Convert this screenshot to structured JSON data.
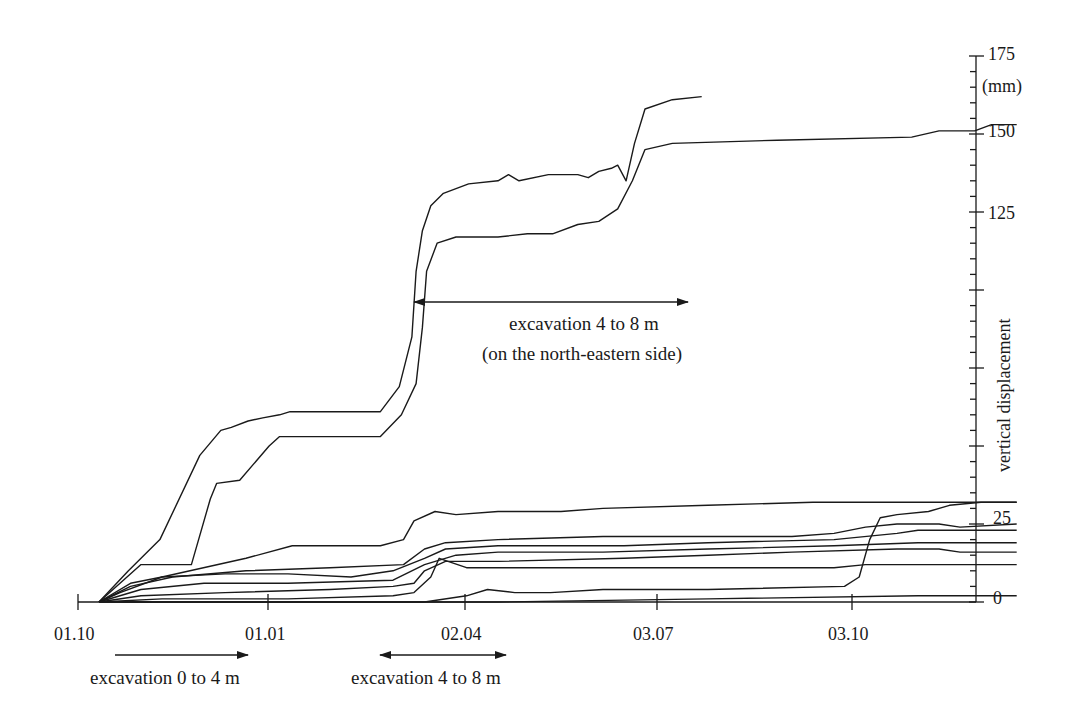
{
  "chart_data": {
    "type": "line",
    "title": "",
    "xlabel": "",
    "ylabel": "vertical displacement",
    "y_unit": "(mm)",
    "ylim": [
      0,
      175
    ],
    "y_ticks": [
      0,
      25,
      125,
      150,
      175
    ],
    "y_tick_labels": [
      "0",
      "25",
      "125",
      "150",
      "175"
    ],
    "y_minor_tick_step": 5,
    "y_axis_position": "right",
    "x_ticks": [
      "01.10",
      "01.01",
      "02.04",
      "03.07",
      "03.10"
    ],
    "x_unit_note": "x values below are approximate days since 01.10",
    "grid": false,
    "legend": null,
    "annotations": [
      {
        "text": "excavation 4 to 8 m",
        "subtext": "(on the north-eastern side)",
        "arrow": "double",
        "x_range_days": [
          163,
          291
        ],
        "y_mm": 99
      },
      {
        "text": "excavation 0 to 4 m",
        "arrow": "right",
        "x_range_days": [
          7,
          80
        ],
        "position": "below-axis"
      },
      {
        "text": "excavation 4 to 8 m",
        "arrow": "double",
        "x_range_days": [
          143,
          205
        ],
        "position": "below-axis"
      }
    ],
    "series": [
      {
        "name": "curve-1",
        "points": [
          [
            10,
            0
          ],
          [
            24,
            10
          ],
          [
            39,
            20
          ],
          [
            58,
            47
          ],
          [
            68,
            55
          ],
          [
            73,
            56
          ],
          [
            81,
            58
          ],
          [
            88,
            59
          ],
          [
            96,
            60
          ],
          [
            101,
            61
          ],
          [
            144,
            61
          ],
          [
            153,
            69
          ],
          [
            159,
            85
          ],
          [
            161,
            106
          ],
          [
            164,
            119
          ],
          [
            168,
            127
          ],
          [
            174,
            131
          ],
          [
            186,
            134
          ],
          [
            200,
            135
          ],
          [
            205,
            137
          ],
          [
            210,
            135
          ],
          [
            224,
            137
          ],
          [
            238,
            137
          ],
          [
            243,
            136
          ],
          [
            248,
            138
          ],
          [
            254,
            139
          ],
          [
            257,
            140
          ],
          [
            261,
            135
          ],
          [
            265,
            147
          ],
          [
            270,
            158
          ],
          [
            283,
            161
          ],
          [
            297,
            162
          ]
        ]
      },
      {
        "name": "curve-2",
        "points": [
          [
            10,
            0
          ],
          [
            30,
            12
          ],
          [
            54,
            12
          ],
          [
            63,
            33
          ],
          [
            66,
            38
          ],
          [
            77,
            39
          ],
          [
            91,
            50
          ],
          [
            96,
            53
          ],
          [
            144,
            53
          ],
          [
            154,
            60
          ],
          [
            161,
            70
          ],
          [
            164,
            88
          ],
          [
            166,
            106
          ],
          [
            171,
            115
          ],
          [
            180,
            117
          ],
          [
            200,
            117
          ],
          [
            214,
            118
          ],
          [
            226,
            118
          ],
          [
            238,
            121
          ],
          [
            248,
            122
          ],
          [
            257,
            126
          ],
          [
            264,
            135
          ],
          [
            270,
            145
          ],
          [
            283,
            147
          ],
          [
            333,
            148
          ],
          [
            397,
            149
          ],
          [
            410,
            151
          ],
          [
            427,
            151
          ],
          [
            435,
            153
          ],
          [
            447,
            153
          ]
        ]
      },
      {
        "name": "curve-3",
        "points": [
          [
            10,
            0
          ],
          [
            20,
            3
          ],
          [
            40,
            8
          ],
          [
            80,
            14
          ],
          [
            102,
            18
          ],
          [
            144,
            18
          ],
          [
            155,
            20
          ],
          [
            160,
            26
          ],
          [
            170,
            29
          ],
          [
            180,
            28
          ],
          [
            200,
            29
          ],
          [
            215,
            29
          ],
          [
            230,
            29
          ],
          [
            250,
            30
          ],
          [
            300,
            31
          ],
          [
            350,
            32
          ],
          [
            400,
            32
          ],
          [
            447,
            32
          ]
        ]
      },
      {
        "name": "curve-4",
        "points": [
          [
            10,
            0
          ],
          [
            25,
            5
          ],
          [
            45,
            8
          ],
          [
            80,
            10
          ],
          [
            120,
            11
          ],
          [
            155,
            12
          ],
          [
            165,
            17
          ],
          [
            175,
            19
          ],
          [
            200,
            20
          ],
          [
            250,
            21
          ],
          [
            300,
            21
          ],
          [
            340,
            21
          ],
          [
            360,
            22
          ],
          [
            375,
            24
          ],
          [
            390,
            25
          ],
          [
            410,
            25
          ],
          [
            420,
            24
          ],
          [
            447,
            25
          ]
        ]
      },
      {
        "name": "curve-5",
        "points": [
          [
            10,
            0
          ],
          [
            25,
            6
          ],
          [
            40,
            8
          ],
          [
            70,
            9
          ],
          [
            100,
            9
          ],
          [
            130,
            8
          ],
          [
            150,
            10
          ],
          [
            165,
            14
          ],
          [
            175,
            17
          ],
          [
            200,
            18
          ],
          [
            260,
            18
          ],
          [
            300,
            19
          ],
          [
            360,
            20
          ],
          [
            390,
            22
          ],
          [
            400,
            23
          ],
          [
            447,
            23
          ]
        ]
      },
      {
        "name": "curve-6",
        "points": [
          [
            10,
            0
          ],
          [
            30,
            4
          ],
          [
            60,
            6
          ],
          [
            100,
            6
          ],
          [
            150,
            7
          ],
          [
            165,
            12
          ],
          [
            180,
            15
          ],
          [
            200,
            16
          ],
          [
            250,
            16
          ],
          [
            300,
            17
          ],
          [
            360,
            18
          ],
          [
            400,
            19
          ],
          [
            447,
            19
          ]
        ]
      },
      {
        "name": "curve-7",
        "points": [
          [
            10,
            0
          ],
          [
            30,
            2
          ],
          [
            70,
            3
          ],
          [
            120,
            4
          ],
          [
            150,
            5
          ],
          [
            160,
            6
          ],
          [
            165,
            10
          ],
          [
            175,
            13
          ],
          [
            200,
            13
          ],
          [
            260,
            14
          ],
          [
            300,
            15
          ],
          [
            340,
            16
          ],
          [
            390,
            17
          ],
          [
            410,
            17
          ],
          [
            420,
            16
          ],
          [
            447,
            16
          ]
        ]
      },
      {
        "name": "curve-8",
        "points": [
          [
            10,
            0
          ],
          [
            40,
            1
          ],
          [
            100,
            1
          ],
          [
            150,
            2
          ],
          [
            160,
            3
          ],
          [
            168,
            8
          ],
          [
            172,
            14
          ],
          [
            185,
            11
          ],
          [
            200,
            11
          ],
          [
            220,
            11
          ],
          [
            260,
            11
          ],
          [
            300,
            11
          ],
          [
            360,
            11
          ],
          [
            375,
            12
          ],
          [
            447,
            12
          ]
        ]
      },
      {
        "name": "curve-9",
        "points": [
          [
            10,
            0
          ],
          [
            50,
            0
          ],
          [
            120,
            0
          ],
          [
            165,
            0
          ],
          [
            185,
            2
          ],
          [
            195,
            4
          ],
          [
            208,
            3
          ],
          [
            225,
            3
          ],
          [
            250,
            4
          ],
          [
            300,
            4
          ],
          [
            365,
            5
          ],
          [
            372,
            8
          ],
          [
            377,
            20
          ],
          [
            382,
            27
          ],
          [
            390,
            28
          ],
          [
            405,
            29
          ],
          [
            415,
            31
          ],
          [
            430,
            32
          ],
          [
            447,
            32
          ]
        ]
      },
      {
        "name": "curve-10",
        "points": [
          [
            10,
            0
          ],
          [
            60,
            0
          ],
          [
            150,
            0
          ],
          [
            200,
            0
          ],
          [
            300,
            1
          ],
          [
            400,
            2
          ],
          [
            447,
            2
          ]
        ]
      }
    ]
  },
  "labels": {
    "y_unit": "(mm)",
    "y_axis_title": "vertical displacement",
    "y_tick_0": "0",
    "y_tick_25": "25",
    "y_tick_125": "125",
    "y_tick_150": "150",
    "y_tick_175": "175",
    "x_tick_1": "01.10",
    "x_tick_2": "01.01",
    "x_tick_3": "02.04",
    "x_tick_4": "03.07",
    "x_tick_5": "03.10",
    "annot_main_line1": "excavation 4 to 8 m",
    "annot_main_line2": "(on the north-eastern side)",
    "annot_bottom_1": "excavation 0 to 4 m",
    "annot_bottom_2": "excavation 4 to 8 m"
  }
}
